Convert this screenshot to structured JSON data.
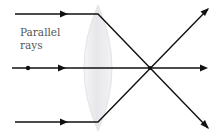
{
  "diagram": {
    "label": {
      "line1": "Parallel",
      "line2": "rays"
    },
    "colors": {
      "ray": "#111111",
      "lens_fill": "#e9e9ec",
      "lens_edge": "#d8d8dc",
      "label": "#555555",
      "background": "#ffffff"
    },
    "lens": {
      "type": "biconvex",
      "center_x": 98,
      "top_y": 5,
      "bottom_y": 131,
      "half_thickness": 14
    },
    "focal_point": {
      "x": 150,
      "y": 68
    },
    "rays": [
      {
        "name": "top-ray",
        "incident_y": 14,
        "start_x": 15,
        "lens_x": 98,
        "end": {
          "x": 208,
          "y": 128
        },
        "has_dot": false
      },
      {
        "name": "axis-ray",
        "incident_y": 68,
        "start_x": 12,
        "lens_x": 98,
        "end": {
          "x": 206,
          "y": 68
        },
        "has_dot": true,
        "dot_x": 28
      },
      {
        "name": "bottom-ray",
        "incident_y": 122,
        "start_x": 15,
        "lens_x": 98,
        "end": {
          "x": 208,
          "y": 9
        },
        "has_dot": false
      }
    ]
  }
}
